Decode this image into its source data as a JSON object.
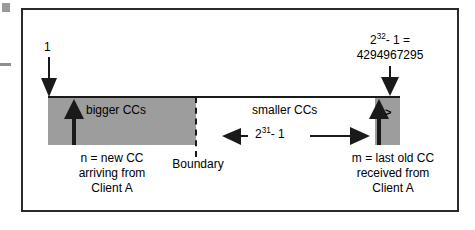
{
  "figure": {
    "colors": {
      "shaded_zone": "#9d9d9d",
      "line": "#1a1a1a",
      "frame": "#2b2b2b",
      "background": "#ffffff"
    }
  },
  "axis": {
    "min_label": "1",
    "max_label_line1_base": "2",
    "max_label_line1_exp": "32",
    "max_label_line1_rest": "- 1 =",
    "max_label_line2": "4294967295"
  },
  "zones": {
    "bigger_label": "bigger CCs",
    "smaller_label": "smaller CCs",
    "wrap_marker": ">"
  },
  "span": {
    "base": "2",
    "exponent": "31",
    "suffix": "- 1"
  },
  "boundary": {
    "label": "Boundary"
  },
  "captions": {
    "left": {
      "line1": "n = new CC",
      "line2": "arriving from",
      "line3": "Client A"
    },
    "right": {
      "line1": "m = last old CC",
      "line2": "received from",
      "line3": "Client A"
    }
  }
}
